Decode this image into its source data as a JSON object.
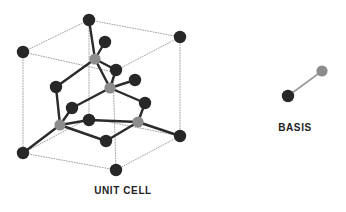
{
  "figure": {
    "title_unit_cell": "UNIT CELL",
    "title_basis": "BASIS",
    "background_color": "#ffffff",
    "colors": {
      "atom_dark": "#272727",
      "atom_gray": "#8c8c8c",
      "bond": "#2b2b2b",
      "cell_edge": "#9a9a9a",
      "text": "#222222"
    },
    "geometry": {
      "atom_radius_dark": 6.2,
      "atom_radius_gray": 5.6,
      "bond_width": 2.4,
      "cell_edge_width": 0.9,
      "cell_edge_dash": "1,1.6"
    },
    "unit_cell": {
      "cube_vertices": [
        {
          "name": "top-back",
          "x": 89,
          "y": 20
        },
        {
          "name": "top-left",
          "x": 23,
          "y": 52
        },
        {
          "name": "top-right",
          "x": 180,
          "y": 37
        },
        {
          "name": "top-front",
          "x": 113,
          "y": 72
        },
        {
          "name": "bottom-back",
          "x": 89,
          "y": 118
        },
        {
          "name": "bottom-left",
          "x": 23,
          "y": 153
        },
        {
          "name": "bottom-right",
          "x": 180,
          "y": 136
        },
        {
          "name": "bottom-front",
          "x": 116,
          "y": 170
        }
      ],
      "cube_edges": [
        [
          "top-back",
          "top-left"
        ],
        [
          "top-back",
          "top-right"
        ],
        [
          "top-left",
          "top-front"
        ],
        [
          "top-right",
          "top-front"
        ],
        [
          "bottom-back",
          "bottom-left"
        ],
        [
          "bottom-back",
          "bottom-right"
        ],
        [
          "bottom-left",
          "bottom-front"
        ],
        [
          "bottom-right",
          "bottom-front"
        ],
        [
          "top-back",
          "bottom-back"
        ],
        [
          "top-left",
          "bottom-left"
        ],
        [
          "top-right",
          "bottom-right"
        ],
        [
          "top-front",
          "bottom-front"
        ]
      ],
      "atoms": [
        {
          "id": "c1",
          "role": "corner",
          "color": "dark",
          "x": 89,
          "y": 20
        },
        {
          "id": "c2",
          "role": "corner",
          "color": "dark",
          "x": 23,
          "y": 52
        },
        {
          "id": "c3",
          "role": "corner",
          "color": "dark",
          "x": 180,
          "y": 37
        },
        {
          "id": "c4",
          "role": "corner",
          "color": "dark",
          "x": 23,
          "y": 153
        },
        {
          "id": "c5",
          "role": "corner",
          "color": "dark",
          "x": 180,
          "y": 136
        },
        {
          "id": "c6",
          "role": "corner",
          "color": "dark",
          "x": 116,
          "y": 170
        },
        {
          "id": "f1",
          "role": "face",
          "color": "dark",
          "x": 105,
          "y": 42
        },
        {
          "id": "f2",
          "role": "face",
          "color": "dark",
          "x": 56,
          "y": 87
        },
        {
          "id": "f3",
          "role": "face",
          "color": "dark",
          "x": 116,
          "y": 70
        },
        {
          "id": "f4",
          "role": "face",
          "color": "dark",
          "x": 135,
          "y": 80
        },
        {
          "id": "f5",
          "role": "face",
          "color": "dark",
          "x": 72,
          "y": 108
        },
        {
          "id": "f6",
          "role": "face",
          "color": "dark",
          "x": 145,
          "y": 103
        },
        {
          "id": "f7",
          "role": "face",
          "color": "dark",
          "x": 89,
          "y": 120
        },
        {
          "id": "f8",
          "role": "face",
          "color": "dark",
          "x": 106,
          "y": 141
        },
        {
          "id": "t1",
          "role": "tetra",
          "color": "gray",
          "x": 95,
          "y": 59
        },
        {
          "id": "t2",
          "role": "tetra",
          "color": "gray",
          "x": 110,
          "y": 88
        },
        {
          "id": "t3",
          "role": "tetra",
          "color": "gray",
          "x": 60,
          "y": 125
        },
        {
          "id": "t4",
          "role": "tetra",
          "color": "gray",
          "x": 138,
          "y": 122
        }
      ],
      "bonds": [
        [
          "c1",
          "t1"
        ],
        [
          "f1",
          "t1"
        ],
        [
          "f3",
          "t1"
        ],
        [
          "t1",
          "f2"
        ],
        [
          "f2",
          "t3"
        ],
        [
          "f3",
          "t2"
        ],
        [
          "f4",
          "t2"
        ],
        [
          "f5",
          "t2"
        ],
        [
          "f6",
          "t2"
        ],
        [
          "t2",
          "t1"
        ],
        [
          "f5",
          "t3"
        ],
        [
          "t3",
          "c4"
        ],
        [
          "t3",
          "f7"
        ],
        [
          "t3",
          "f8"
        ],
        [
          "f6",
          "t4"
        ],
        [
          "t4",
          "f8"
        ],
        [
          "t4",
          "c5"
        ],
        [
          "t4",
          "f7"
        ]
      ]
    },
    "basis": {
      "atoms": [
        {
          "id": "b1",
          "color": "dark",
          "x": 288,
          "y": 96
        },
        {
          "id": "b2",
          "color": "gray",
          "x": 322,
          "y": 71
        }
      ],
      "bond": [
        "b1",
        "b2"
      ]
    }
  }
}
